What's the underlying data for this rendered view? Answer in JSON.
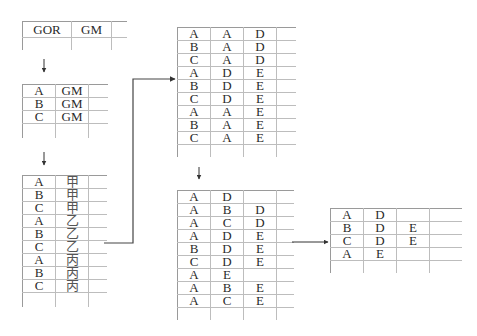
{
  "tables": [
    {
      "id": "source",
      "col_widths": [
        48,
        39,
        15
      ],
      "row_height": 15,
      "rows": [
        [
          "GOR",
          "GM",
          ""
        ],
        [
          "",
          "",
          ""
        ]
      ]
    },
    {
      "id": "gor-gm",
      "col_widths": [
        32,
        32,
        19
      ],
      "row_height": 14,
      "rows": [
        [
          "A",
          "GM",
          ""
        ],
        [
          "B",
          "GM",
          ""
        ],
        [
          "C",
          "GM",
          ""
        ],
        [
          "",
          "",
          ""
        ]
      ]
    },
    {
      "id": "expanded",
      "col_widths": [
        32,
        32,
        18
      ],
      "row_height": 14,
      "rows": [
        [
          "A",
          "甲",
          ""
        ],
        [
          "B",
          "甲",
          ""
        ],
        [
          "C",
          "甲",
          ""
        ],
        [
          "A",
          "乙",
          ""
        ],
        [
          "B",
          "乙",
          ""
        ],
        [
          "C",
          "乙",
          ""
        ],
        [
          "A",
          "丙",
          ""
        ],
        [
          "B",
          "丙",
          ""
        ],
        [
          "C",
          "丙",
          ""
        ],
        [
          "",
          "",
          ""
        ]
      ]
    },
    {
      "id": "mapped",
      "col_widths": [
        32,
        32,
        32,
        19
      ],
      "row_height": 13,
      "rows": [
        [
          "A",
          "A",
          "D",
          ""
        ],
        [
          "B",
          "A",
          "D",
          ""
        ],
        [
          "C",
          "A",
          "D",
          ""
        ],
        [
          "A",
          "D",
          "E",
          ""
        ],
        [
          "B",
          "D",
          "E",
          ""
        ],
        [
          "C",
          "D",
          "E",
          ""
        ],
        [
          "A",
          "A",
          "E",
          ""
        ],
        [
          "B",
          "A",
          "E",
          ""
        ],
        [
          "C",
          "A",
          "E",
          ""
        ],
        [
          "",
          "",
          "",
          ""
        ]
      ]
    },
    {
      "id": "resolved",
      "col_widths": [
        32,
        32,
        32,
        17
      ],
      "row_height": 13,
      "rows": [
        [
          "A",
          "D",
          "",
          ""
        ],
        [
          "A",
          "B",
          "D",
          ""
        ],
        [
          "A",
          "C",
          "D",
          ""
        ],
        [
          "A",
          "D",
          "E",
          ""
        ],
        [
          "B",
          "D",
          "E",
          ""
        ],
        [
          "C",
          "D",
          "E",
          ""
        ],
        [
          "A",
          "E",
          "",
          ""
        ],
        [
          "A",
          "B",
          "E",
          ""
        ],
        [
          "A",
          "C",
          "E",
          ""
        ],
        [
          "",
          "",
          "",
          ""
        ]
      ]
    },
    {
      "id": "result",
      "col_widths": [
        33,
        33,
        33,
        33
      ],
      "row_height": 13,
      "rows": [
        [
          "A",
          "D",
          "",
          ""
        ],
        [
          "B",
          "D",
          "E",
          ""
        ],
        [
          "C",
          "D",
          "E",
          ""
        ],
        [
          "A",
          "E",
          "",
          ""
        ],
        [
          "",
          "",
          "",
          ""
        ]
      ]
    }
  ],
  "connectors": [
    {
      "name": "arrow-down-1",
      "type": "down-arrow"
    },
    {
      "name": "arrow-down-2",
      "type": "down-arrow"
    },
    {
      "name": "arrow-expanded-to-mapped",
      "type": "elbow-arrow"
    },
    {
      "name": "arrow-down-3",
      "type": "down-arrow"
    },
    {
      "name": "arrow-resolved-to-result",
      "type": "right-arrow"
    }
  ],
  "colors": {
    "text": "#2a2a2a",
    "grid": "#bdbdbd",
    "arrow": "#333333"
  }
}
